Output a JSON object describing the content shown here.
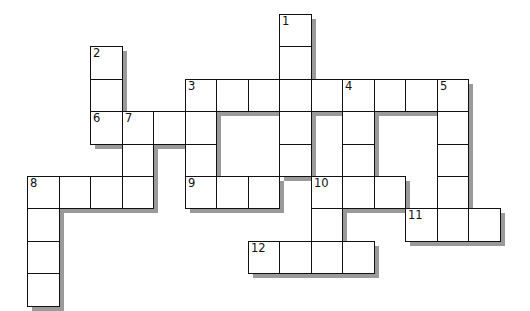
{
  "puzzle": {
    "type": "crossword",
    "grid": {
      "origin_x": 27,
      "origin_y": 14,
      "cell_w": 31.5,
      "cell_h": 32.4,
      "cols": 15,
      "rows": 9
    },
    "colors": {
      "border": "#111111",
      "cell_fill": "#ffffff",
      "shadow": "#9a9a9a",
      "background": "#ffffff"
    },
    "entries": [
      {
        "number": "1",
        "direction": "down",
        "col": 8,
        "row": 0,
        "length": 5
      },
      {
        "number": "2",
        "direction": "down",
        "col": 2,
        "row": 1,
        "length": 3
      },
      {
        "number": "3",
        "direction": "across",
        "col": 5,
        "row": 2,
        "length": 9
      },
      {
        "number": "3",
        "direction": "down",
        "col": 5,
        "row": 2,
        "length": 4
      },
      {
        "number": "4",
        "direction": "down",
        "col": 10,
        "row": 2,
        "length": 4
      },
      {
        "number": "5",
        "direction": "down",
        "col": 13,
        "row": 2,
        "length": 5
      },
      {
        "number": "6",
        "direction": "across",
        "col": 2,
        "row": 3,
        "length": 4
      },
      {
        "number": "7",
        "direction": "down",
        "col": 3,
        "row": 3,
        "length": 3
      },
      {
        "number": "8",
        "direction": "across",
        "col": 0,
        "row": 5,
        "length": 4
      },
      {
        "number": "8",
        "direction": "down",
        "col": 0,
        "row": 5,
        "length": 4
      },
      {
        "number": "9",
        "direction": "across",
        "col": 5,
        "row": 5,
        "length": 3
      },
      {
        "number": "10",
        "direction": "across",
        "col": 9,
        "row": 5,
        "length": 3
      },
      {
        "number": "10",
        "direction": "down",
        "col": 9,
        "row": 5,
        "length": 3
      },
      {
        "number": "11",
        "direction": "across",
        "col": 12,
        "row": 6,
        "length": 3
      },
      {
        "number": "12",
        "direction": "across",
        "col": 7,
        "row": 7,
        "length": 4
      }
    ],
    "cell_values": {}
  }
}
